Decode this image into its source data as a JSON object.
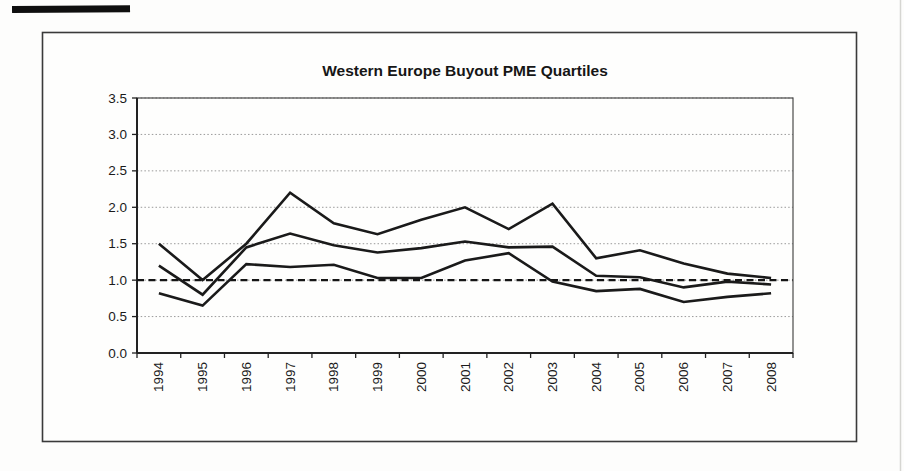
{
  "page": {
    "background_color": "#fdfdfc",
    "frame_border_color": "#3a3a3a",
    "scan_artifact_color": "#0f0f0f"
  },
  "chart_data": {
    "type": "line",
    "title": "Western Europe Buyout PME Quartiles",
    "xlabel": "",
    "ylabel": "",
    "categories": [
      "1994",
      "1995",
      "1996",
      "1997",
      "1998",
      "1999",
      "2000",
      "2001",
      "2002",
      "2003",
      "2004",
      "2005",
      "2006",
      "2007",
      "2008"
    ],
    "series": [
      {
        "name": "upper-quartile",
        "values": [
          1.5,
          1.0,
          1.5,
          2.2,
          1.78,
          1.63,
          1.83,
          2.0,
          1.7,
          2.05,
          1.3,
          1.41,
          1.23,
          1.09,
          1.03
        ]
      },
      {
        "name": "median",
        "values": [
          1.2,
          0.8,
          1.45,
          1.64,
          1.48,
          1.38,
          1.44,
          1.53,
          1.45,
          1.46,
          1.06,
          1.04,
          0.9,
          0.98,
          0.94
        ]
      },
      {
        "name": "lower-quartile",
        "values": [
          0.82,
          0.65,
          1.22,
          1.18,
          1.21,
          1.03,
          1.03,
          1.27,
          1.37,
          0.98,
          0.85,
          0.88,
          0.7,
          0.77,
          0.82
        ]
      }
    ],
    "reference_line": {
      "value": 1.0,
      "style": "dashed"
    },
    "ylim": [
      0.0,
      3.5
    ],
    "ytick_step": 0.5,
    "ytick_labels": [
      "0.0",
      "0.5",
      "1.0",
      "1.5",
      "2.0",
      "2.5",
      "3.0",
      "3.5"
    ],
    "x_label_rotation": -90,
    "grid": true,
    "legend_position": "none",
    "style": {
      "line_color": "#1a1a1a",
      "line_width": 2.6,
      "grid_color": "#9a9a9a",
      "axis_color": "#222222",
      "plot_border_color": "#4a4a4a",
      "label_color": "#1a1a1a"
    }
  }
}
